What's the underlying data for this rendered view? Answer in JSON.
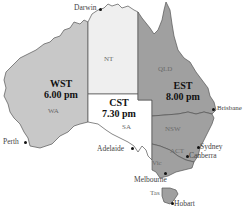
{
  "map": {
    "title": "Australian time zones",
    "colors": {
      "wst": "#c8c8c8",
      "nt": "#efefef",
      "cst": "#ffffff",
      "est": "#a0a0a0",
      "border": "#555555"
    },
    "zones": [
      {
        "id": "wst",
        "abbr": "WST",
        "time": "6.00 pm"
      },
      {
        "id": "cst",
        "abbr": "CST",
        "time": "7.30 pm"
      },
      {
        "id": "est",
        "abbr": "EST",
        "time": "8.00 pm"
      }
    ],
    "states": [
      {
        "id": "wa",
        "label": "WA"
      },
      {
        "id": "nt",
        "label": "NT"
      },
      {
        "id": "sa",
        "label": "SA"
      },
      {
        "id": "qld",
        "label": "QLD"
      },
      {
        "id": "nsw",
        "label": "NSW"
      },
      {
        "id": "act",
        "label": "ACT"
      },
      {
        "id": "vic",
        "label": "Vic"
      },
      {
        "id": "tas",
        "label": "Tas"
      }
    ],
    "cities": [
      {
        "id": "darwin",
        "label": "Darwin"
      },
      {
        "id": "perth",
        "label": "Perth"
      },
      {
        "id": "adelaide",
        "label": "Adelaide"
      },
      {
        "id": "brisbane",
        "label": "Brisbane"
      },
      {
        "id": "sydney",
        "label": "Sydney"
      },
      {
        "id": "canberra",
        "label": "Canberra"
      },
      {
        "id": "melbourne",
        "label": "Melbourne"
      },
      {
        "id": "hobart",
        "label": "Hobart"
      }
    ]
  }
}
